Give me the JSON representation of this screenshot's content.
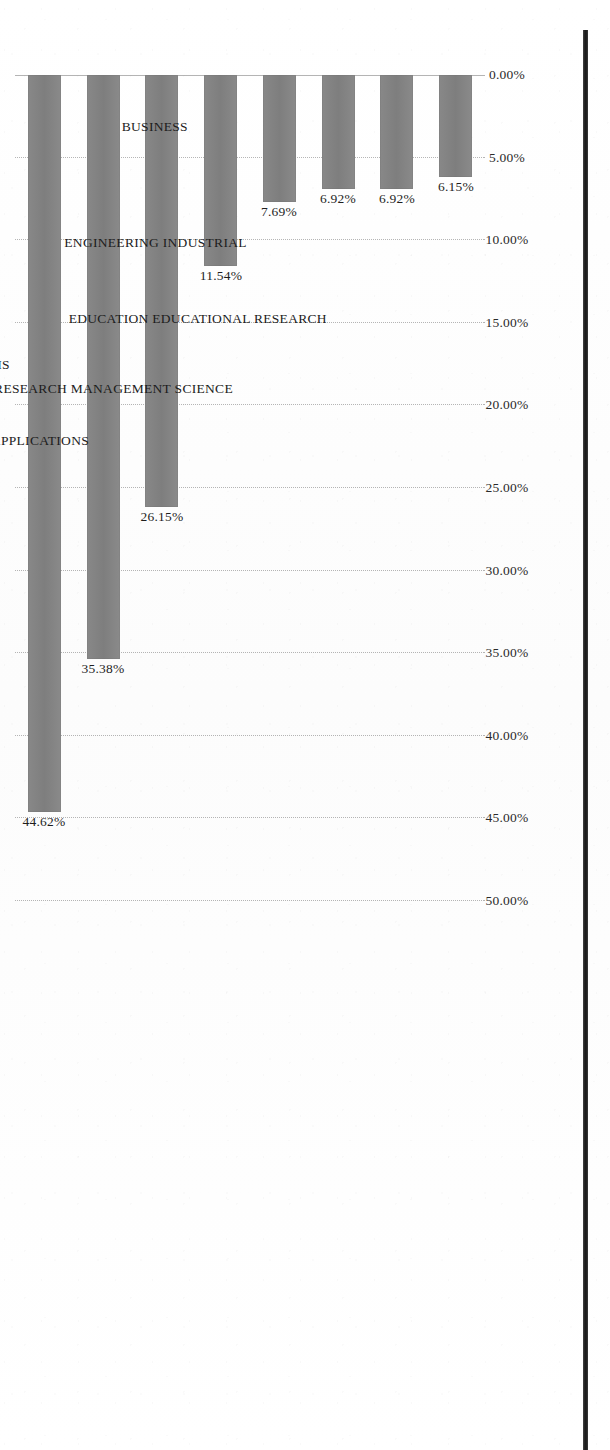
{
  "chart_data": {
    "type": "bar",
    "title": "",
    "subtitle": "",
    "xlabel": "",
    "ylabel": "",
    "orientation": "vertical-rotated-90-clockwise",
    "grid": true,
    "legend": null,
    "ylim": [
      0,
      50
    ],
    "axis_tick_labels": [
      "0.00%",
      "5.00%",
      "10.00%",
      "15.00%",
      "20.00%",
      "25.00%",
      "30.00%",
      "35.00%",
      "40.00%",
      "45.00%",
      "50.00%"
    ],
    "axis_tick_values": [
      0,
      5,
      10,
      15,
      20,
      25,
      30,
      35,
      40,
      45,
      50
    ],
    "categories": [
      "EDUCATION EDUCATIONAL RESEARCH",
      "OPERATIONS RESEARCH MANAGEMENT SCIENCE",
      "ENGINEERING INDUSTRIAL",
      "COMPUTER SCIENCE INTERDISCIPLINARY APPLICATIONS",
      "BUSINESS",
      "COMPUTER SCIENCE INFORMATION SYSTEMS",
      "INFORMATION SCIENCE LIBRARY SCIENCE",
      "MANAGEMENT"
    ],
    "values": [
      6.15,
      6.92,
      6.92,
      7.69,
      11.54,
      26.15,
      35.38,
      44.62
    ],
    "value_labels": [
      "6.15%",
      "6.92%",
      "6.92%",
      "7.69%",
      "11.54%",
      "26.15%",
      "35.38%",
      "44.62%"
    ],
    "colors": {
      "bar_fill": "#808080",
      "gridline": "#787878",
      "text": "#1c1c1c",
      "background": "#fdfdfd",
      "page_edge": "#0f0f0f"
    }
  }
}
